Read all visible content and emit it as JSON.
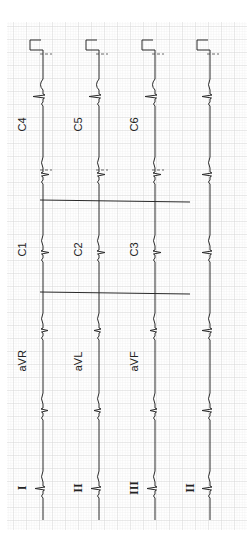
{
  "ecg": {
    "orientation": "rotated-90-ccw",
    "grid": {
      "x": 7,
      "y": 22,
      "width": 240,
      "height": 508,
      "minor_color": "#e4e4e4",
      "major_color": "#cfcfcf",
      "minor_step": 2.6,
      "major_step": 13
    },
    "trace_color": "#2a2a2a",
    "rows": [
      {
        "baseline_x": 43,
        "labels": [
          "I",
          "aVR",
          "C1",
          "C4"
        ]
      },
      {
        "baseline_x": 99,
        "labels": [
          "II",
          "aVL",
          "C2",
          "C5"
        ]
      },
      {
        "baseline_x": 155,
        "labels": [
          "III",
          "aVF",
          "C3",
          "C6"
        ]
      },
      {
        "baseline_x": 210,
        "labels": [
          "II"
        ]
      }
    ],
    "labels": [
      {
        "text": "C4",
        "x": 22,
        "y": 125,
        "roman": false
      },
      {
        "text": "C5",
        "x": 78,
        "y": 125,
        "roman": false
      },
      {
        "text": "C6",
        "x": 134,
        "y": 125,
        "roman": false
      },
      {
        "text": "C1",
        "x": 22,
        "y": 250,
        "roman": false
      },
      {
        "text": "C2",
        "x": 78,
        "y": 250,
        "roman": false
      },
      {
        "text": "C3",
        "x": 134,
        "y": 250,
        "roman": false
      },
      {
        "text": "aVR",
        "x": 22,
        "y": 362,
        "roman": false
      },
      {
        "text": "aVL",
        "x": 78,
        "y": 362,
        "roman": false
      },
      {
        "text": "aVF",
        "x": 134,
        "y": 362,
        "roman": false
      },
      {
        "text": "I",
        "x": 22,
        "y": 488,
        "roman": true
      },
      {
        "text": "II",
        "x": 78,
        "y": 488,
        "roman": true
      },
      {
        "text": "III",
        "x": 134,
        "y": 488,
        "roman": true
      },
      {
        "text": "II",
        "x": 190,
        "y": 488,
        "roman": true
      }
    ]
  }
}
